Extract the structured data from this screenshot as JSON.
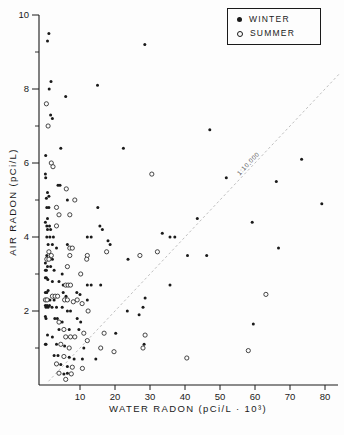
{
  "chart_data": {
    "type": "scatter",
    "title": "",
    "xlabel": "WATER RADON (pCi/L · 10³)",
    "ylabel": "AIR RADON (pCi/L)",
    "xlim": [
      0,
      80
    ],
    "ylim": [
      0,
      10
    ],
    "x_ticks": [
      10,
      20,
      30,
      40,
      50,
      60,
      70,
      80
    ],
    "y_ticks": [
      2,
      4,
      6,
      8,
      10
    ],
    "y_minor_ticks": [
      1,
      3,
      5,
      7,
      9
    ],
    "grid": false,
    "legend_position": "top-right",
    "legend": [
      {
        "label": "WINTER",
        "marker": "filled-circle"
      },
      {
        "label": "SUMMER",
        "marker": "open-circle"
      }
    ],
    "reference_line": {
      "label": "1:10,000",
      "slope_air_per_water": 0.1,
      "style": "dashed"
    },
    "series": [
      {
        "name": "WINTER",
        "marker": "filled-circle",
        "points": [
          [
            1.1,
            9.5
          ],
          [
            0.7,
            9.3
          ],
          [
            28.5,
            9.2
          ],
          [
            1.7,
            8.2
          ],
          [
            1.2,
            8.0
          ],
          [
            15.0,
            8.1
          ],
          [
            5.9,
            7.8
          ],
          [
            1.6,
            7.3
          ],
          [
            2.1,
            7.2
          ],
          [
            4.5,
            6.4
          ],
          [
            22.4,
            6.4
          ],
          [
            0.2,
            6.2
          ],
          [
            47.1,
            6.9
          ],
          [
            73.3,
            6.1
          ],
          [
            0.1,
            5.7
          ],
          [
            0.2,
            5.6
          ],
          [
            3.7,
            5.4
          ],
          [
            4.3,
            5.4
          ],
          [
            0.7,
            5.2
          ],
          [
            1.1,
            5.1
          ],
          [
            0.4,
            5.05
          ],
          [
            6.4,
            5.0
          ],
          [
            51.8,
            5.6
          ],
          [
            66.1,
            5.5
          ],
          [
            0.5,
            4.8
          ],
          [
            1.1,
            4.8
          ],
          [
            15.1,
            4.8
          ],
          [
            0.7,
            4.5
          ],
          [
            0.1,
            4.4
          ],
          [
            0.5,
            4.3
          ],
          [
            1.3,
            4.3
          ],
          [
            0.7,
            4.2
          ],
          [
            1.6,
            4.2
          ],
          [
            15.7,
            4.3
          ],
          [
            16.4,
            4.2
          ],
          [
            43.5,
            4.5
          ],
          [
            79.1,
            4.9
          ],
          [
            59.2,
            4.4
          ],
          [
            0.5,
            4.0
          ],
          [
            1.4,
            4.0
          ],
          [
            2.4,
            4.0
          ],
          [
            12.1,
            4.0
          ],
          [
            13.2,
            4.0
          ],
          [
            18.0,
            3.9
          ],
          [
            18.6,
            3.8
          ],
          [
            33.5,
            4.1
          ],
          [
            35.7,
            4.0
          ],
          [
            37.1,
            4.0
          ],
          [
            66.7,
            3.7
          ],
          [
            0.9,
            3.8
          ],
          [
            2.1,
            3.8
          ],
          [
            3.3,
            3.7
          ],
          [
            6.4,
            3.8
          ],
          [
            0.5,
            3.5
          ],
          [
            2.1,
            3.4
          ],
          [
            23.7,
            3.4
          ],
          [
            40.7,
            3.5
          ],
          [
            46.2,
            3.5
          ],
          [
            0.1,
            3.3
          ],
          [
            0.7,
            3.2
          ],
          [
            1.6,
            3.2
          ],
          [
            0.1,
            3.1
          ],
          [
            0.4,
            3.1
          ],
          [
            2.6,
            3.1
          ],
          [
            4.9,
            3.0
          ],
          [
            0.1,
            2.9
          ],
          [
            0.4,
            2.9
          ],
          [
            0.8,
            2.85
          ],
          [
            2.1,
            2.8
          ],
          [
            4.0,
            2.8
          ],
          [
            5.2,
            2.7
          ],
          [
            12.1,
            2.7
          ],
          [
            13.2,
            2.7
          ],
          [
            15.9,
            2.7
          ],
          [
            35.7,
            2.7
          ],
          [
            0.1,
            2.5
          ],
          [
            0.5,
            2.5
          ],
          [
            0.9,
            2.55
          ],
          [
            5.2,
            2.5
          ],
          [
            6.0,
            2.4
          ],
          [
            9.1,
            2.5
          ],
          [
            10.0,
            2.45
          ],
          [
            28.6,
            2.35
          ],
          [
            1.4,
            2.3
          ],
          [
            2.6,
            2.3
          ],
          [
            12.1,
            2.3
          ],
          [
            28.0,
            2.1
          ],
          [
            0.1,
            2.15
          ],
          [
            0.3,
            2.1
          ],
          [
            0.6,
            2.15
          ],
          [
            0.9,
            2.1
          ],
          [
            1.3,
            2.15
          ],
          [
            2.0,
            2.1
          ],
          [
            3.3,
            2.1
          ],
          [
            4.9,
            2.1
          ],
          [
            6.4,
            2.0
          ],
          [
            7.3,
            2.0
          ],
          [
            23.5,
            2.0
          ],
          [
            26.9,
            1.9
          ],
          [
            0.1,
            1.85
          ],
          [
            0.3,
            1.8
          ],
          [
            2.8,
            1.8
          ],
          [
            3.5,
            1.8
          ],
          [
            4.9,
            1.7
          ],
          [
            9.2,
            1.8
          ],
          [
            10.2,
            1.7
          ],
          [
            59.5,
            1.65
          ],
          [
            4.0,
            1.5
          ],
          [
            6.9,
            1.5
          ],
          [
            9.7,
            1.5
          ],
          [
            20.2,
            1.4
          ],
          [
            0.7,
            1.35
          ],
          [
            2.1,
            1.3
          ],
          [
            28.3,
            1.1
          ],
          [
            0.1,
            1.1
          ],
          [
            0.3,
            1.1
          ],
          [
            3.3,
            1.1
          ],
          [
            5.6,
            1.05
          ],
          [
            11.1,
            1.0
          ],
          [
            2.6,
            0.8
          ],
          [
            3.7,
            0.8
          ],
          [
            6.9,
            0.75
          ],
          [
            8.3,
            0.7
          ],
          [
            10.7,
            0.7
          ],
          [
            14.5,
            0.7
          ],
          [
            4.5,
            0.55
          ],
          [
            6.4,
            0.5
          ],
          [
            5.4,
            0.3
          ],
          [
            6.4,
            0.32
          ]
        ]
      },
      {
        "name": "SUMMER",
        "marker": "open-circle",
        "points": [
          [
            0.4,
            7.6
          ],
          [
            0.9,
            7.0
          ],
          [
            1.8,
            6.0
          ],
          [
            2.3,
            5.9
          ],
          [
            6.1,
            5.3
          ],
          [
            30.5,
            5.7
          ],
          [
            8.5,
            5.0
          ],
          [
            3.3,
            4.8
          ],
          [
            4.0,
            4.6
          ],
          [
            7.1,
            4.6
          ],
          [
            3.3,
            4.3
          ],
          [
            7.1,
            3.7
          ],
          [
            7.8,
            3.7
          ],
          [
            17.6,
            3.6
          ],
          [
            1.1,
            3.6
          ],
          [
            1.8,
            3.5
          ],
          [
            7.1,
            3.5
          ],
          [
            12.1,
            3.5
          ],
          [
            0.5,
            3.4
          ],
          [
            1.1,
            3.4
          ],
          [
            11.9,
            3.4
          ],
          [
            6.4,
            3.2
          ],
          [
            10.2,
            3.0
          ],
          [
            32.1,
            3.6
          ],
          [
            27.1,
            3.5
          ],
          [
            5.9,
            2.7
          ],
          [
            6.6,
            2.7
          ],
          [
            7.3,
            2.7
          ],
          [
            2.1,
            2.4
          ],
          [
            2.9,
            2.4
          ],
          [
            3.6,
            2.4
          ],
          [
            0.1,
            2.3
          ],
          [
            0.6,
            2.3
          ],
          [
            5.6,
            2.3
          ],
          [
            6.4,
            2.3
          ],
          [
            8.1,
            2.25
          ],
          [
            9.2,
            2.3
          ],
          [
            10.6,
            2.2
          ],
          [
            63.1,
            2.45
          ],
          [
            12.3,
            2.0
          ],
          [
            4.0,
            1.7
          ],
          [
            5.4,
            1.5
          ],
          [
            11.1,
            1.4
          ],
          [
            16.9,
            1.4
          ],
          [
            5.9,
            1.3
          ],
          [
            7.3,
            1.3
          ],
          [
            8.5,
            1.3
          ],
          [
            12.1,
            1.2
          ],
          [
            28.6,
            1.35
          ],
          [
            4.5,
            1.1
          ],
          [
            6.9,
            1.0
          ],
          [
            15.9,
            1.0
          ],
          [
            19.7,
            0.9
          ],
          [
            28.0,
            1.0
          ],
          [
            58.1,
            0.93
          ],
          [
            40.5,
            0.73
          ],
          [
            5.4,
            0.77
          ],
          [
            3.3,
            0.57
          ],
          [
            7.8,
            0.48
          ],
          [
            10.7,
            0.45
          ],
          [
            4.0,
            0.32
          ],
          [
            7.5,
            0.3
          ],
          [
            5.9,
            0.15
          ]
        ]
      }
    ]
  }
}
